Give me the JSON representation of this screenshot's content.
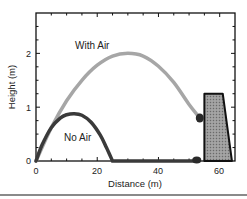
{
  "chart_data": {
    "type": "line",
    "title": "",
    "xlabel": "Distance (m)",
    "ylabel": "Height (m)",
    "xlim": [
      0,
      65
    ],
    "ylim": [
      0,
      2.75
    ],
    "x_ticks": [
      0,
      20,
      40,
      60
    ],
    "y_ticks": [
      0,
      1,
      2
    ],
    "grid": false,
    "legend": "none (inline annotations)",
    "series": [
      {
        "name": "With Air",
        "color": "#a6a6a6",
        "points": [
          [
            0,
            0
          ],
          [
            5,
            0.62
          ],
          [
            10,
            1.12
          ],
          [
            15,
            1.5
          ],
          [
            20,
            1.78
          ],
          [
            25,
            1.95
          ],
          [
            30,
            2.0
          ],
          [
            35,
            1.95
          ],
          [
            40,
            1.76
          ],
          [
            45,
            1.46
          ],
          [
            50,
            1.05
          ],
          [
            53.5,
            0.8
          ]
        ],
        "end_marker": [
          53.5,
          0.8
        ]
      },
      {
        "name": "No Air",
        "color": "#3a3a3a",
        "points": [
          [
            0,
            0
          ],
          [
            2,
            0.3
          ],
          [
            5,
            0.62
          ],
          [
            8,
            0.8
          ],
          [
            10,
            0.86
          ],
          [
            12.5,
            0.88
          ],
          [
            15,
            0.85
          ],
          [
            18,
            0.72
          ],
          [
            21,
            0.48
          ],
          [
            23,
            0.25
          ],
          [
            25,
            0
          ],
          [
            52.5,
            0
          ]
        ],
        "end_marker": [
          52.5,
          0
        ]
      }
    ],
    "annotations": [
      {
        "text": "With Air",
        "x": 14,
        "y": 2.2
      },
      {
        "text": "No Air",
        "x": 11,
        "y": 0.42
      }
    ],
    "wall": {
      "polygon": [
        [
          55,
          0
        ],
        [
          55,
          1.25
        ],
        [
          61,
          1.25
        ],
        [
          64,
          0
        ]
      ],
      "fill": "hatched gray",
      "stroke": "#111111"
    }
  },
  "labels": {
    "xlabel": "Distance (m)",
    "ylabel": "Height (m)",
    "x_ticks": [
      "0",
      "20",
      "40",
      "60"
    ],
    "y_ticks": [
      "0",
      "1",
      "2"
    ],
    "with_air": "With Air",
    "no_air": "No Air"
  }
}
